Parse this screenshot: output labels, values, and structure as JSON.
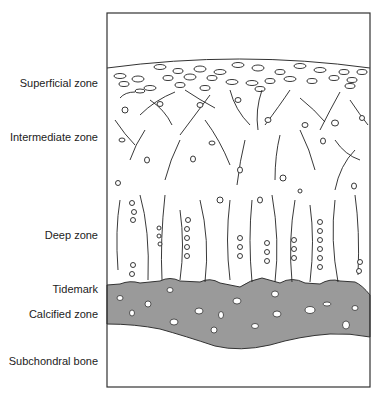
{
  "diagram": {
    "type": "articular-cartilage-zones",
    "labels": [
      {
        "id": "superficial",
        "text": "Superficial zone",
        "y": 77
      },
      {
        "id": "intermediate",
        "text": "Intermediate zone",
        "y": 131
      },
      {
        "id": "deep",
        "text": "Deep zone",
        "y": 229
      },
      {
        "id": "tidemark",
        "text": "Tidemark",
        "y": 283
      },
      {
        "id": "calcified",
        "text": "Calcified zone",
        "y": 308
      },
      {
        "id": "subchondral",
        "text": "Subchondral bone",
        "y": 355
      }
    ],
    "colors": {
      "outline": "#333333",
      "calcified_fill": "#9a9a9a",
      "background": "#ffffff"
    }
  }
}
